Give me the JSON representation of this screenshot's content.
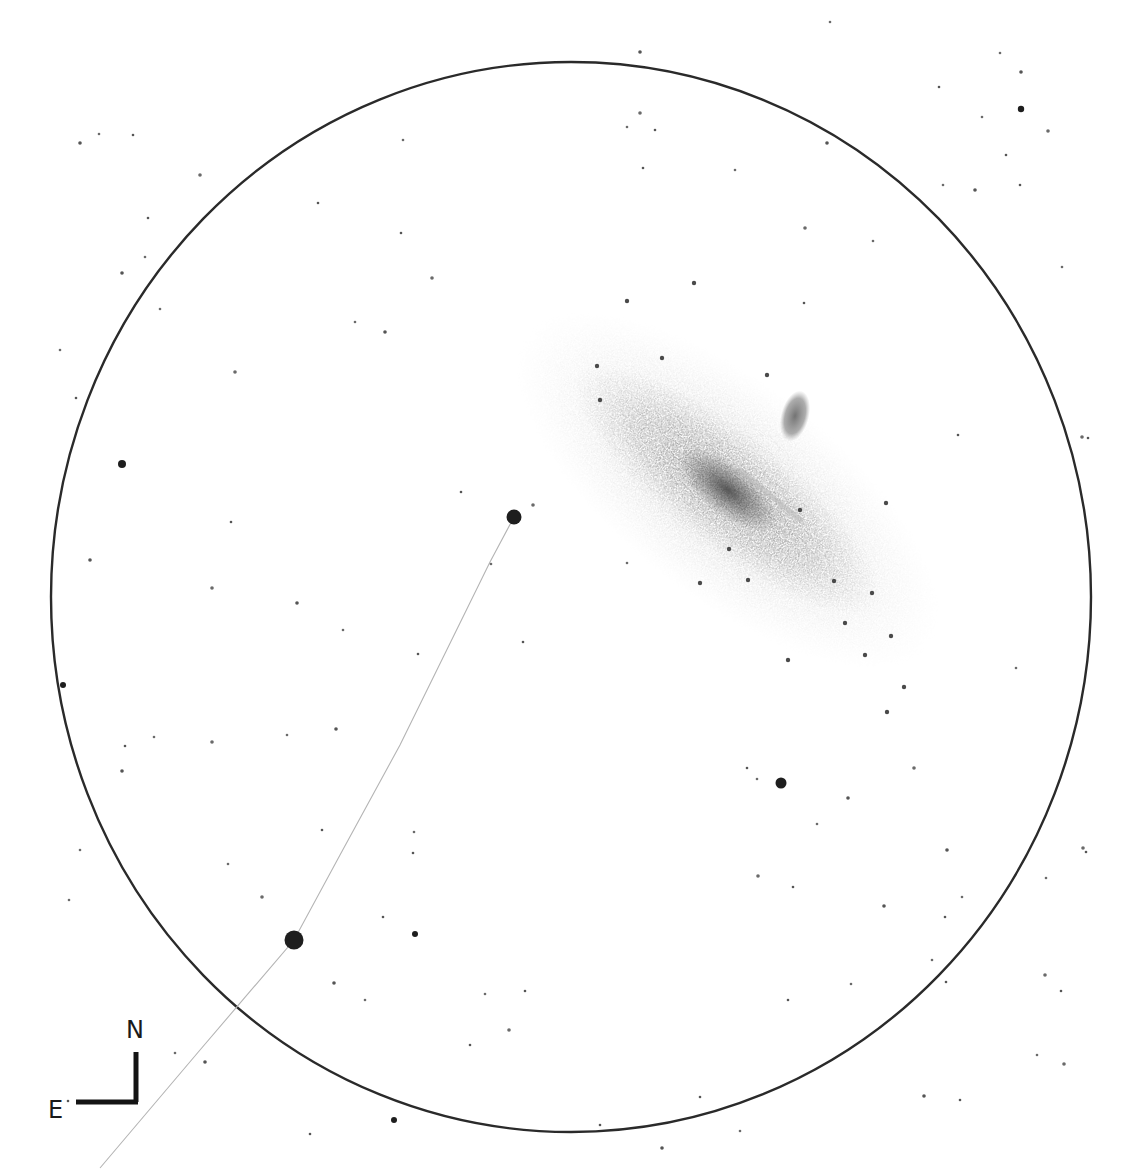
{
  "canvas": {
    "width": 1133,
    "height": 1173,
    "background": "#ffffff"
  },
  "field_of_view": {
    "cx": 571,
    "cy": 597,
    "rx": 520,
    "ry": 535,
    "stroke": "#2a2a2a",
    "stroke_width": 2.4
  },
  "galaxy": {
    "name": "M31",
    "center": [
      728,
      490
    ],
    "angle_deg": 38,
    "halo": {
      "rx": 255,
      "ry": 108,
      "color": "#9a9a9a"
    },
    "disk": {
      "rx": 190,
      "ry": 58,
      "color": "#7c7c7c"
    },
    "core": {
      "rx": 60,
      "ry": 26,
      "color": "#5e5e5e"
    },
    "dust_lane": {
      "from": [
        740,
        470
      ],
      "to": [
        800,
        520
      ],
      "color": "#b8b8b8"
    },
    "companion": {
      "name": "M32",
      "center": [
        795,
        416
      ],
      "rx": 14,
      "ry": 26,
      "angle_deg": 15,
      "color": "#7a7a7a"
    }
  },
  "guide_line": {
    "points": [
      [
        514,
        517
      ],
      [
        490,
        562
      ],
      [
        400,
        745
      ],
      [
        340,
        855
      ],
      [
        294,
        940
      ],
      [
        200,
        1050
      ],
      [
        100,
        1168
      ]
    ],
    "color": "#b4b4b4"
  },
  "bright_stars": [
    {
      "x": 514,
      "y": 517,
      "r": 7.5
    },
    {
      "x": 294,
      "y": 940,
      "r": 9.5
    },
    {
      "x": 781,
      "y": 783,
      "r": 5.5
    },
    {
      "x": 122,
      "y": 464,
      "r": 4
    },
    {
      "x": 1021,
      "y": 109,
      "r": 3.2
    },
    {
      "x": 394,
      "y": 1120,
      "r": 3
    },
    {
      "x": 415,
      "y": 934,
      "r": 3
    },
    {
      "x": 63,
      "y": 685,
      "r": 3
    }
  ],
  "faint_stars": [
    [
      80,
      143
    ],
    [
      99,
      134
    ],
    [
      133,
      135
    ],
    [
      200,
      175
    ],
    [
      148,
      218
    ],
    [
      145,
      257
    ],
    [
      122,
      273
    ],
    [
      160,
      309
    ],
    [
      76,
      398
    ],
    [
      235,
      372
    ],
    [
      318,
      203
    ],
    [
      355,
      322
    ],
    [
      385,
      332
    ],
    [
      403,
      140
    ],
    [
      401,
      233
    ],
    [
      432,
      278
    ],
    [
      461,
      492
    ],
    [
      491,
      564
    ],
    [
      297,
      603
    ],
    [
      343,
      630
    ],
    [
      418,
      654
    ],
    [
      212,
      588
    ],
    [
      231,
      522
    ],
    [
      287,
      735
    ],
    [
      336,
      729
    ],
    [
      414,
      832
    ],
    [
      413,
      853
    ],
    [
      212,
      742
    ],
    [
      125,
      746
    ],
    [
      154,
      737
    ],
    [
      122,
      771
    ],
    [
      228,
      864
    ],
    [
      322,
      830
    ],
    [
      262,
      897
    ],
    [
      383,
      917
    ],
    [
      365,
      1000
    ],
    [
      334,
      983
    ],
    [
      485,
      994
    ],
    [
      525,
      991
    ],
    [
      509,
      1030
    ],
    [
      470,
      1045
    ],
    [
      175,
      1053
    ],
    [
      205,
      1062
    ],
    [
      69,
      900
    ],
    [
      68,
      1101
    ],
    [
      533,
      505
    ],
    [
      523,
      642
    ],
    [
      627,
      563
    ],
    [
      640,
      52
    ],
    [
      627,
      127
    ],
    [
      655,
      130
    ],
    [
      640,
      113
    ],
    [
      643,
      168
    ],
    [
      735,
      170
    ],
    [
      827,
      143
    ],
    [
      873,
      241
    ],
    [
      804,
      303
    ],
    [
      805,
      228
    ],
    [
      939,
      87
    ],
    [
      1000,
      53
    ],
    [
      1021,
      72
    ],
    [
      982,
      117
    ],
    [
      1006,
      155
    ],
    [
      1048,
      131
    ],
    [
      1020,
      185
    ],
    [
      943,
      185
    ],
    [
      975,
      190
    ],
    [
      1062,
      267
    ],
    [
      1088,
      438
    ],
    [
      1082,
      437
    ],
    [
      958,
      435
    ],
    [
      1016,
      668
    ],
    [
      947,
      850
    ],
    [
      1046,
      878
    ],
    [
      1086,
      852
    ],
    [
      1083,
      848
    ],
    [
      945,
      917
    ],
    [
      962,
      897
    ],
    [
      884,
      906
    ],
    [
      932,
      960
    ],
    [
      946,
      982
    ],
    [
      1045,
      975
    ],
    [
      1061,
      991
    ],
    [
      1037,
      1055
    ],
    [
      924,
      1096
    ],
    [
      851,
      984
    ],
    [
      788,
      1000
    ],
    [
      758,
      876
    ],
    [
      793,
      887
    ],
    [
      817,
      824
    ],
    [
      848,
      798
    ],
    [
      757,
      779
    ],
    [
      747,
      768
    ],
    [
      914,
      768
    ],
    [
      700,
      1097
    ],
    [
      740,
      1131
    ],
    [
      662,
      1148
    ],
    [
      830,
      22
    ],
    [
      960,
      1100
    ],
    [
      1064,
      1064
    ],
    [
      600,
      1125
    ],
    [
      80,
      850
    ],
    [
      90,
      560
    ],
    [
      60,
      350
    ],
    [
      310,
      1134
    ]
  ],
  "galaxy_stars": [
    [
      627,
      301
    ],
    [
      694,
      283
    ],
    [
      662,
      358
    ],
    [
      597,
      366
    ],
    [
      600,
      400
    ],
    [
      767,
      375
    ],
    [
      886,
      503
    ],
    [
      800,
      510
    ],
    [
      700,
      583
    ],
    [
      748,
      580
    ],
    [
      729,
      549
    ],
    [
      788,
      660
    ],
    [
      891,
      636
    ],
    [
      887,
      712
    ],
    [
      834,
      581
    ],
    [
      872,
      593
    ],
    [
      904,
      687
    ],
    [
      865,
      655
    ],
    [
      845,
      623
    ]
  ],
  "compass": {
    "corner": [
      136,
      1102
    ],
    "north_length": 50,
    "east_length": 60,
    "north_label": "N",
    "east_label": "E",
    "color": "#141414"
  }
}
